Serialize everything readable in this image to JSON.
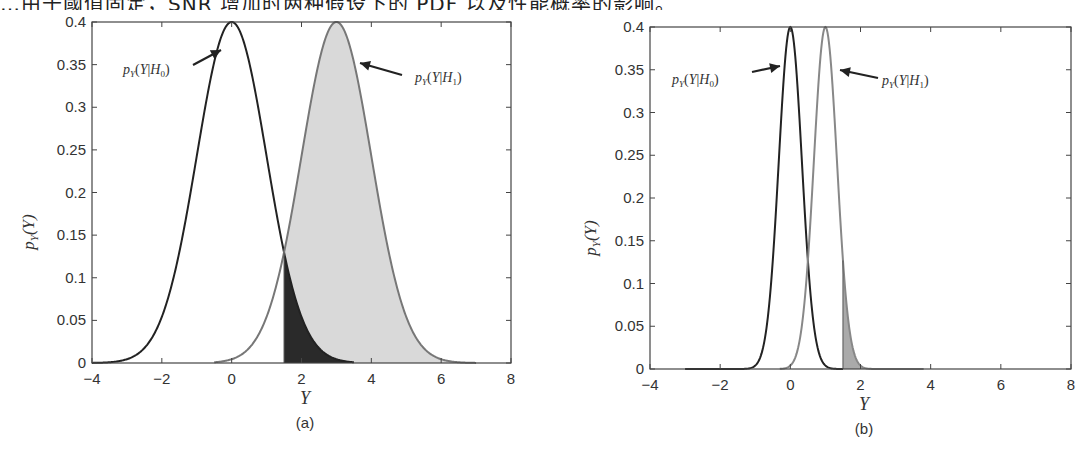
{
  "caption": {
    "text": "…由于阈值固定，SNR 增加时两种假设下的 PDF 以及性能概率的影响。"
  },
  "chart_data": [
    {
      "type": "area",
      "panel_label": "(a)",
      "title": "",
      "xlabel": "Υ",
      "ylabel": "p_Υ(Υ)",
      "xlim": [
        -4,
        8
      ],
      "ylim": [
        0,
        0.4
      ],
      "xticks": [
        -4,
        -2,
        0,
        2,
        4,
        6,
        8
      ],
      "yticks": [
        0,
        0.05,
        0.1,
        0.15,
        0.2,
        0.25,
        0.3,
        0.35,
        0.4
      ],
      "xtick_labels": [
        "−4",
        "−2",
        "0",
        "2",
        "4",
        "6",
        "8"
      ],
      "ytick_labels": [
        "0",
        "0.05",
        "0.1",
        "0.15",
        "0.2",
        "0.25",
        "0.3",
        "0.35",
        "0.4"
      ],
      "grid": false,
      "threshold": 1.5,
      "series": [
        {
          "name": "p_Υ(Υ|H0)",
          "distribution": "gaussian",
          "mean": 0,
          "std": 1,
          "peak": 0.4,
          "x_range": [
            -4,
            3.5
          ],
          "color": "#222222",
          "x": [
            -4,
            -3,
            -2,
            -1,
            0,
            1,
            1.5,
            2,
            3
          ],
          "values": [
            0.0001,
            0.0044,
            0.054,
            0.242,
            0.399,
            0.242,
            0.13,
            0.054,
            0.0044
          ]
        },
        {
          "name": "p_Υ(Υ|H1)",
          "distribution": "gaussian",
          "mean": 3,
          "std": 1,
          "peak": 0.4,
          "x_range": [
            -0.5,
            7
          ],
          "color": "#777777",
          "x": [
            0,
            1,
            1.5,
            2,
            3,
            4,
            5,
            6,
            7
          ],
          "values": [
            0.0044,
            0.054,
            0.13,
            0.242,
            0.399,
            0.242,
            0.054,
            0.0044,
            0.0001
          ]
        }
      ],
      "annotations": [
        {
          "text_id": "H0",
          "label": "p_Υ(Υ|H0)",
          "points_to": [
            -0.3,
            0.37
          ]
        },
        {
          "text_id": "H1",
          "label": "p_Υ(Υ|H1)",
          "points_to": [
            3.6,
            0.36
          ]
        }
      ],
      "shaded_regions": [
        {
          "name": "P_D (detection)",
          "under": "H1",
          "from": 1.5,
          "to": 7,
          "color": "#d9d9d9"
        },
        {
          "name": "P_FA (false alarm)",
          "under": "H0",
          "from": 1.5,
          "to": 3.5,
          "color": "#2a2a2a"
        }
      ]
    },
    {
      "type": "area",
      "panel_label": "(b)",
      "title": "",
      "xlabel": "Υ",
      "ylabel": "p_Υ(Υ)",
      "xlim": [
        -4,
        8
      ],
      "ylim": [
        0,
        0.4
      ],
      "xticks": [
        -4,
        -2,
        0,
        2,
        4,
        6,
        8
      ],
      "yticks": [
        0,
        0.05,
        0.1,
        0.15,
        0.2,
        0.25,
        0.3,
        0.35,
        0.4
      ],
      "xtick_labels": [
        "−4",
        "−2",
        "0",
        "2",
        "4",
        "6",
        "8"
      ],
      "ytick_labels": [
        "0",
        "0.05",
        "0.1",
        "0.15",
        "0.2",
        "0.25",
        "0.3",
        "0.35",
        "0.4"
      ],
      "grid": false,
      "threshold": 1.5,
      "series": [
        {
          "name": "p_Υ(Υ|H0)",
          "distribution": "gaussian-shaped",
          "mean": 0,
          "std": 0.33,
          "peak": 0.4,
          "x_range": [
            -3,
            1.5
          ],
          "color": "#222222",
          "x": [
            -1.2,
            -0.8,
            -0.4,
            0,
            0.4,
            0.8,
            1.2
          ],
          "values": [
            0.0005,
            0.02,
            0.19,
            0.4,
            0.19,
            0.02,
            0.0005
          ]
        },
        {
          "name": "p_Υ(Υ|H1)",
          "distribution": "gaussian-shaped",
          "mean": 1,
          "std": 0.33,
          "peak": 0.4,
          "x_range": [
            -0.3,
            3.8
          ],
          "color": "#888888",
          "x": [
            -0.2,
            0.2,
            0.6,
            1,
            1.4,
            1.5,
            1.8,
            2.2
          ],
          "values": [
            0.0005,
            0.02,
            0.19,
            0.4,
            0.19,
            0.13,
            0.02,
            0.0005
          ]
        }
      ],
      "annotations": [
        {
          "text_id": "H0",
          "label": "p_Υ(Υ|H0)",
          "points_to": [
            -0.1,
            0.36
          ]
        },
        {
          "text_id": "H1",
          "label": "p_Υ(Υ|H1)",
          "points_to": [
            1.2,
            0.355
          ]
        }
      ],
      "shaded_regions": [
        {
          "name": "P_D (detection)",
          "under": "H1",
          "from": 1.5,
          "to": 3.8,
          "color": "#aaaaaa"
        }
      ]
    }
  ],
  "panels": {
    "a": {
      "label": "(a)",
      "xlabel": "Υ",
      "ylabel_p": "p",
      "ylabel_sub": "Υ",
      "ylabel_arg": "(Υ)"
    },
    "b": {
      "label": "(b)",
      "xlabel": "Υ",
      "ylabel_p": "p",
      "ylabel_sub": "Υ",
      "ylabel_arg": "(Υ)"
    }
  }
}
